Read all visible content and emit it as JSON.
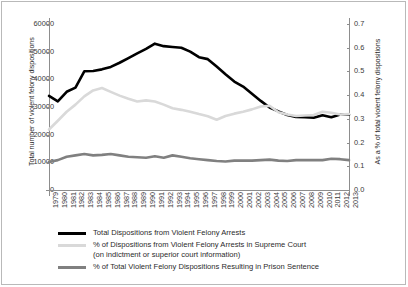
{
  "chart_data": {
    "type": "line",
    "title": "",
    "xlabel": "",
    "ylabel": "Total number of violent felony dispositions",
    "y2label": "As a % of total violent felony dispositions",
    "ylim": [
      0,
      60000
    ],
    "y2lim": [
      0.0,
      0.7
    ],
    "grid": false,
    "legend_position": "bottom",
    "categories": [
      "1979",
      "1980",
      "1981",
      "1982",
      "1983",
      "1984",
      "1985",
      "1986",
      "1987",
      "1988",
      "1989",
      "1990",
      "1991",
      "1992",
      "1993",
      "1994",
      "1995",
      "1996",
      "1997",
      "1998",
      "1999",
      "2000",
      "2001",
      "2002",
      "2003",
      "2004",
      "2005",
      "2006",
      "2007",
      "2008",
      "2009",
      "2010",
      "2011",
      "2012",
      "2013"
    ],
    "yticks": [
      "0",
      "10000",
      "20000",
      "30000",
      "40000",
      "50000",
      "60000"
    ],
    "ytick_values": [
      0,
      10000,
      20000,
      30000,
      40000,
      50000,
      60000
    ],
    "y2ticks": [
      "0.0",
      "0.1",
      "0.2",
      "0.3",
      "0.4",
      "0.5",
      "0.6",
      "0.7"
    ],
    "y2tick_values": [
      0.0,
      0.1,
      0.2,
      0.3,
      0.4,
      0.5,
      0.6,
      0.7
    ],
    "series": [
      {
        "name": "Total Dispositions from Violent Felony Arrests",
        "axis": "left",
        "color": "#000000",
        "width": 2.6,
        "values": [
          34000,
          32000,
          35500,
          37000,
          42900,
          43000,
          43600,
          44500,
          46000,
          47700,
          49400,
          51000,
          52900,
          52000,
          51700,
          51400,
          50000,
          48000,
          47300,
          44600,
          41800,
          39200,
          37400,
          34800,
          32200,
          29800,
          28400,
          27100,
          26400,
          26300,
          26100,
          27000,
          26300,
          27300,
          27200
        ]
      },
      {
        "name": "% of Dispositions from Violent Felony Arrests in Supreme Court (on indictment or superior court information)",
        "axis": "right",
        "color": "#d9d9d9",
        "width": 2.6,
        "values": [
          0.255,
          0.292,
          0.33,
          0.36,
          0.395,
          0.42,
          0.43,
          0.414,
          0.398,
          0.385,
          0.373,
          0.378,
          0.373,
          0.36,
          0.345,
          0.338,
          0.33,
          0.32,
          0.311,
          0.296,
          0.312,
          0.322,
          0.33,
          0.34,
          0.352,
          0.355,
          0.328,
          0.318,
          0.312,
          0.314,
          0.316,
          0.33,
          0.326,
          0.318,
          0.32
        ]
      },
      {
        "name": "% of Total Violent Felony Dispositions Resulting in Prison Sentence",
        "axis": "right",
        "color": "#808080",
        "width": 2.6,
        "values": [
          0.118,
          0.126,
          0.14,
          0.146,
          0.152,
          0.146,
          0.148,
          0.152,
          0.146,
          0.14,
          0.138,
          0.136,
          0.142,
          0.136,
          0.146,
          0.14,
          0.134,
          0.13,
          0.126,
          0.122,
          0.12,
          0.124,
          0.124,
          0.124,
          0.126,
          0.128,
          0.124,
          0.122,
          0.126,
          0.126,
          0.126,
          0.126,
          0.132,
          0.13,
          0.126
        ]
      }
    ],
    "legend": [
      {
        "label": "Total Dispositions from Violent Felony Arrests",
        "sub": "",
        "color": "#000000"
      },
      {
        "label": "% of Dispositions from Violent Felony Arrests in Supreme Court",
        "sub": "(on indictment or superior court information)",
        "color": "#d9d9d9"
      },
      {
        "label": "% of Total Violent Felony Dispositions Resulting in Prison Sentence",
        "sub": "",
        "color": "#808080"
      }
    ]
  }
}
